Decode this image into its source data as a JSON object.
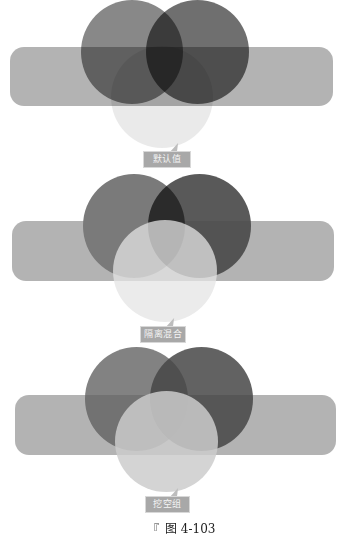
{
  "figure": {
    "caption_mark": "『",
    "caption": "图 4-103",
    "colors": {
      "band": "#969696",
      "circle_left": "#6e6e6e",
      "circle_right": "#555555",
      "circle_bottom": "#e4e4e4",
      "label_bg": "#a8a8a8",
      "label_text": "#f4f4f4"
    }
  },
  "panels": [
    {
      "label": "默认值",
      "description": "Default blending — all overlaps darken"
    },
    {
      "label": "隔离混合",
      "description": "Isolated blending — group blends internally, not with band"
    },
    {
      "label": "挖空组",
      "description": "Knockout group — group members do not blend with each other"
    }
  ]
}
